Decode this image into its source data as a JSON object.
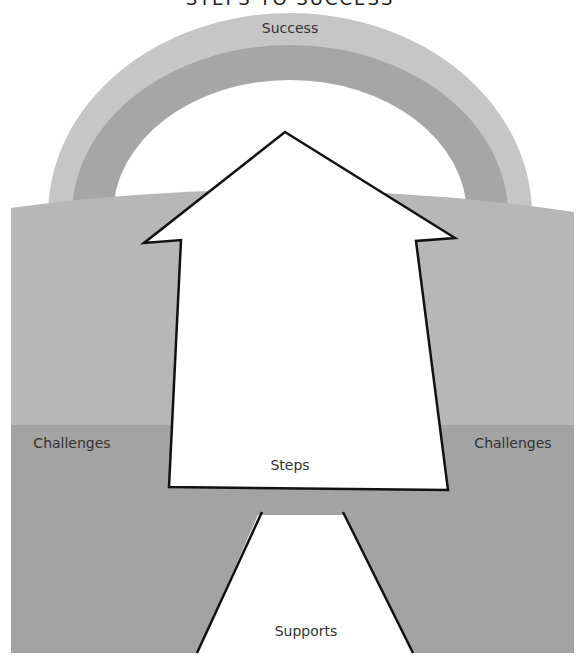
{
  "title": "STEPS TO SUCCESS",
  "labels": {
    "success": "Success",
    "challenges_left": "Challenges",
    "challenges_right": "Challenges",
    "steps": "Steps",
    "supports": "Supports"
  },
  "colors": {
    "arch_outer": "#c6c6c6",
    "arch_inner": "#a6a6a6",
    "field_upper": "#b7b7b7",
    "field_lower": "#a3a3a3",
    "outline": "#111111",
    "shape_fill": "#ffffff"
  }
}
